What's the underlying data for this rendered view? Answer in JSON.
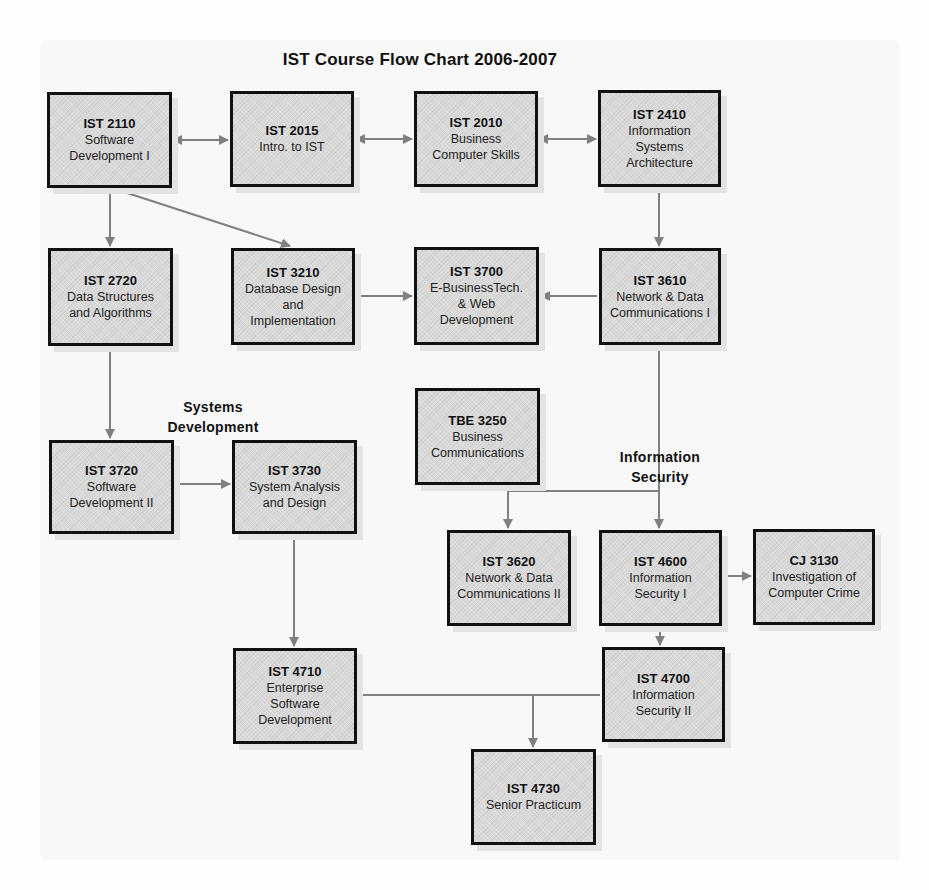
{
  "title": "IST Course Flow Chart 2006-2007",
  "group_labels": {
    "systems_development": "Systems\nDevelopment",
    "information_security": "Information\nSecurity"
  },
  "courses": {
    "ist2110": {
      "code": "IST 2110",
      "name": "Software\nDevelopment I"
    },
    "ist2015": {
      "code": "IST 2015",
      "name": "Intro. to IST"
    },
    "ist2010": {
      "code": "IST 2010",
      "name": "Business\nComputer Skills"
    },
    "ist2410": {
      "code": "IST 2410",
      "name": "Information\nSystems\nArchitecture"
    },
    "ist2720": {
      "code": "IST 2720",
      "name": "Data Structures\nand Algorithms"
    },
    "ist3210": {
      "code": "IST 3210",
      "name": "Database Design\nand\nImplementation"
    },
    "ist3700": {
      "code": "IST 3700",
      "name": "E-BusinessTech.\n& Web\nDevelopment"
    },
    "ist3610": {
      "code": "IST 3610",
      "name": "Network & Data\nCommunications I"
    },
    "tbe3250": {
      "code": "TBE 3250",
      "name": "Business\nCommunications"
    },
    "ist3720": {
      "code": "IST 3720",
      "name": "Software\nDevelopment II"
    },
    "ist3730": {
      "code": "IST 3730",
      "name": "System Analysis\nand Design"
    },
    "ist3620": {
      "code": "IST 3620",
      "name": "Network & Data\nCommunications II"
    },
    "ist4600": {
      "code": "IST 4600",
      "name": "Information\nSecurity I"
    },
    "cj3130": {
      "code": "CJ 3130",
      "name": "Investigation of\nComputer Crime"
    },
    "ist4710": {
      "code": "IST 4710",
      "name": "Enterprise\nSoftware\nDevelopment"
    },
    "ist4700": {
      "code": "IST 4700",
      "name": "Information\nSecurity II"
    },
    "ist4730": {
      "code": "IST 4730",
      "name": "Senior Practicum"
    }
  },
  "connections": [
    {
      "from": "IST 2110",
      "to": "IST 2015",
      "type": "bidirectional"
    },
    {
      "from": "IST 2015",
      "to": "IST 2010",
      "type": "bidirectional"
    },
    {
      "from": "IST 2010",
      "to": "IST 2410",
      "type": "bidirectional"
    },
    {
      "from": "IST 2110",
      "to": "IST 2720",
      "type": "arrow"
    },
    {
      "from": "IST 2110",
      "to": "IST 3210",
      "type": "arrow"
    },
    {
      "from": "IST 2410",
      "to": "IST 3610",
      "type": "arrow"
    },
    {
      "from": "IST 3210",
      "to": "IST 3700",
      "type": "arrow"
    },
    {
      "from": "IST 3610",
      "to": "IST 3700",
      "type": "arrow"
    },
    {
      "from": "IST 2720",
      "to": "IST 3720",
      "type": "arrow"
    },
    {
      "from": "IST 3720",
      "to": "IST 3730",
      "type": "arrow"
    },
    {
      "from": "IST 3610",
      "to": "IST 3620",
      "type": "arrow"
    },
    {
      "from": "IST 3610",
      "to": "IST 4600",
      "type": "arrow"
    },
    {
      "from": "IST 4600",
      "to": "CJ 3130",
      "type": "arrow"
    },
    {
      "from": "IST 4600",
      "to": "IST 4700",
      "type": "arrow"
    },
    {
      "from": "IST 3730",
      "to": "IST 4710",
      "type": "arrow"
    },
    {
      "from": "IST 4710",
      "to": "IST 4730",
      "type": "arrow"
    },
    {
      "from": "IST 4700",
      "to": "IST 4730",
      "type": "arrow"
    }
  ],
  "colors": {
    "box_fill": "#d9d9d9",
    "box_border": "#111111",
    "connector": "#808080"
  }
}
